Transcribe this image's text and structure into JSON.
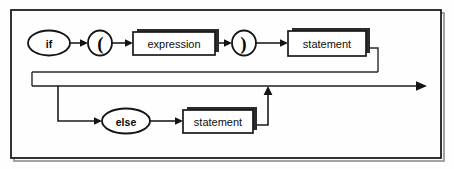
{
  "diagram": {
    "kind": "railroad-syntax-diagram",
    "frame": {
      "x": 11,
      "y": 10,
      "width": 430,
      "height": 148,
      "border_color": "#1f1f1f",
      "background_color": "#fefefe"
    },
    "line_color": "#1c1c1c",
    "nodes": [
      {
        "id": "if",
        "label": "if",
        "shape": "ellipse",
        "kind": "terminal",
        "cx": 49,
        "cy": 43,
        "rx": 21,
        "ry": 12.5
      },
      {
        "id": "lparen",
        "label": "(",
        "shape": "ellipse",
        "kind": "terminal",
        "cx": 100,
        "cy": 43,
        "rx": 12,
        "ry": 12.5
      },
      {
        "id": "expression",
        "label": "expression",
        "shape": "box",
        "kind": "nonterminal",
        "x": 133,
        "y": 32,
        "width": 82,
        "height": 23
      },
      {
        "id": "rparen",
        "label": ")",
        "shape": "ellipse",
        "kind": "terminal",
        "cx": 244,
        "cy": 43,
        "rx": 12,
        "ry": 12.5
      },
      {
        "id": "statement-then",
        "label": "statement",
        "shape": "box",
        "kind": "nonterminal",
        "x": 288,
        "y": 31,
        "width": 78,
        "height": 25
      },
      {
        "id": "else",
        "label": "else",
        "shape": "ellipse",
        "kind": "terminal",
        "cx": 126,
        "cy": 121,
        "rx": 24,
        "ry": 12.5
      },
      {
        "id": "statement-else",
        "label": "statement",
        "shape": "box",
        "kind": "nonterminal",
        "x": 183,
        "y": 110,
        "width": 70,
        "height": 23
      }
    ],
    "paths": [
      {
        "id": "entry-to-if",
        "from": "start",
        "to": "if"
      },
      {
        "id": "if-to-lparen",
        "from": "if",
        "to": "lparen"
      },
      {
        "id": "lparen-to-expression",
        "from": "lparen",
        "to": "expression"
      },
      {
        "id": "expression-to-rparen",
        "from": "expression",
        "to": "rparen"
      },
      {
        "id": "rparen-to-statement",
        "from": "rparen",
        "to": "statement-then"
      },
      {
        "id": "statement-to-mainline",
        "from": "statement-then",
        "to": "main-rail"
      },
      {
        "id": "mainline-exit",
        "from": "main-rail",
        "to": "exit"
      },
      {
        "id": "branch-to-else",
        "from": "main-rail",
        "to": "else"
      },
      {
        "id": "else-to-statement",
        "from": "else",
        "to": "statement-else"
      },
      {
        "id": "statement-else-rejoin",
        "from": "statement-else",
        "to": "main-rail"
      }
    ],
    "main_rail_y": 86,
    "exit_arrow_x": 425
  }
}
